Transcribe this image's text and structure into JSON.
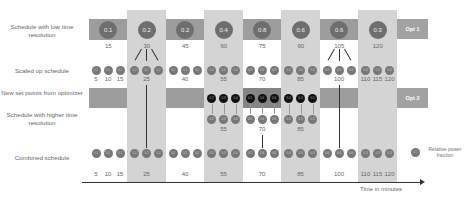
{
  "row_labels": {
    "low_res": "Schedule with low time resolution",
    "scaled": "Scaled up schedule",
    "new_setpoints": "New set points from optimizer",
    "higher_res": "Schedule with higher time resolution",
    "combined": "Combined schedule"
  },
  "opt_labels": {
    "opt1": "Opt 1",
    "opt2": "Opt 2"
  },
  "low_res": {
    "values": [
      "0.1",
      "0.2",
      "0.2",
      "0.4",
      "0.8",
      "0.6",
      "0.6",
      "0.3"
    ],
    "times": [
      "15",
      "30",
      "45",
      "60",
      "75",
      "90",
      "105",
      "120"
    ]
  },
  "scaled": {
    "values": [
      "0.1",
      "0.1",
      "0.1",
      "0.2",
      "0.2",
      "0.2",
      "0.2",
      "0.2",
      "0.2",
      "0.4",
      "0.4",
      "0.4",
      "0.8",
      "0.8",
      "0.8",
      "0.6",
      "0.6",
      "0.6",
      "0.6",
      "0.6",
      "0.6",
      "0.3",
      "0.3",
      "0.3"
    ],
    "times": [
      "5",
      "10",
      "15",
      "25",
      "40",
      "55",
      "70",
      "85",
      "100",
      "110",
      "115",
      "120"
    ]
  },
  "new_setpoints": {
    "values": [
      "0.2",
      "0.3",
      "0.4",
      "0.5",
      "0.6",
      "0.6",
      "0.4",
      "0.3",
      "0.5"
    ]
  },
  "higher_res": {
    "values": [
      "0.2",
      "0.3",
      "0.4",
      "0.5",
      "0.6",
      "0.6",
      "0.4",
      "0.3",
      "0.5"
    ],
    "times": [
      "55",
      "70",
      "85"
    ]
  },
  "combined": {
    "values": [
      "0.1",
      "0.1",
      "0.1",
      "0.2",
      "0.2",
      "0.2",
      "0.2",
      "0.2",
      "0.2",
      "0.2",
      "0.3",
      "0.4",
      "0.5",
      "0.6",
      "0.6",
      "0.4",
      "0.3",
      "0.5",
      "0.6",
      "0.6",
      "0.6",
      "0.3",
      "0.3",
      "0.3"
    ],
    "times": [
      "5",
      "10",
      "15",
      "25",
      "40",
      "55",
      "70",
      "85",
      "100",
      "110",
      "115",
      "120"
    ]
  },
  "legend": {
    "label": "Relative power fraction",
    "sample": "0.1"
  },
  "axis": {
    "label": "Time in minutes"
  }
}
